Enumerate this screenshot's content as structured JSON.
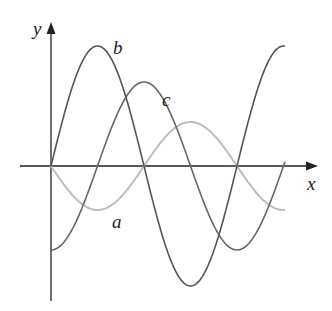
{
  "labels": {
    "x_axis": "x",
    "y_axis": "y",
    "curve_a": "a",
    "curve_b": "b",
    "curve_c": "c"
  },
  "colors": {
    "axes": "#222222",
    "curve_a": "#bdbdbd",
    "curve_b": "#555555",
    "curve_c": "#666666"
  },
  "chart_data": {
    "type": "line",
    "title": "",
    "xlabel": "x",
    "ylabel": "y",
    "series": [
      {
        "name": "a",
        "shape": "negative sine, small amplitude",
        "x_start": 0,
        "amplitude": 0.45
      },
      {
        "name": "b",
        "shape": "sine, large amplitude",
        "x_start": 0,
        "amplitude": 1.0
      },
      {
        "name": "c",
        "shape": "negative cosine, medium amplitude",
        "x_start": 0,
        "amplitude": 0.75
      }
    ]
  }
}
